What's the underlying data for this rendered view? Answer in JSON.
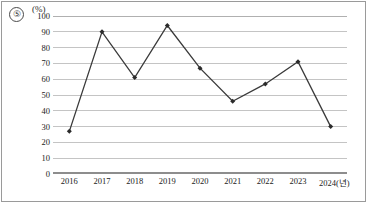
{
  "figure": {
    "item_number": "⑤",
    "unit_label": "(%)"
  },
  "chart_data": {
    "type": "line",
    "title": "",
    "xlabel": "",
    "ylabel": "",
    "unit": "(%)",
    "categories": [
      "2016",
      "2017",
      "2018",
      "2019",
      "2020",
      "2021",
      "2022",
      "2023",
      "2024"
    ],
    "x_tick_labels": [
      "2016",
      "2017",
      "2018",
      "2019",
      "2020",
      "2021",
      "2022",
      "2023",
      "2024(년)"
    ],
    "values": [
      27,
      90,
      61,
      94,
      67,
      46,
      57,
      71,
      30
    ],
    "ylim": [
      0,
      100
    ],
    "y_ticks": [
      0,
      10,
      20,
      30,
      40,
      50,
      60,
      70,
      80,
      90,
      100
    ],
    "y_tick_labels": [
      "0",
      "10",
      "20",
      "30",
      "40",
      "50",
      "60",
      "70",
      "80",
      "90",
      "100"
    ],
    "grid": true,
    "grid_axis": "y",
    "legend": false,
    "legend_position": "none",
    "marker": "diamond",
    "line_color": "#3a3a3a",
    "marker_color": "#2b2b2b",
    "grid_color": "#c4c4c4",
    "axis_color": "#8d8d8d",
    "background_color": "#ffffff"
  }
}
